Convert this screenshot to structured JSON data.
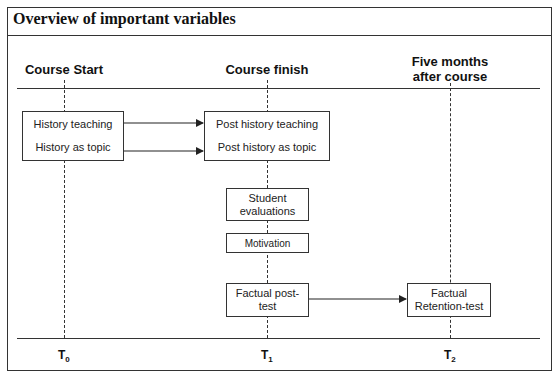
{
  "title": "Overview of important variables",
  "timepoints": [
    {
      "header": "Course Start",
      "label": "T",
      "sub": "0"
    },
    {
      "header": "Course finish",
      "label": "T",
      "sub": "1"
    },
    {
      "header_line1": "Five months",
      "header_line2": "after course",
      "label": "T",
      "sub": "2"
    }
  ],
  "boxes": {
    "baseline": {
      "line1": "History teaching",
      "line2": "History as topic"
    },
    "post": {
      "line1": "Post history teaching",
      "line2": "Post history as topic"
    },
    "student_evaluations": {
      "line1": "Student",
      "line2": "evaluations"
    },
    "motivation": {
      "label": "Motivation"
    },
    "factual_post_test": {
      "line1": "Factual post-",
      "line2": "test"
    },
    "factual_retention_test": {
      "line1": "Factual",
      "line2": "Retention-test"
    }
  }
}
